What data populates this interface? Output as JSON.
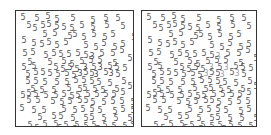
{
  "panels": [
    {
      "id": "left",
      "x": 15,
      "y": 10,
      "w": 119,
      "h": 117,
      "digit_color": "#555555",
      "target_color": "#444444",
      "distractor_digit": "5",
      "target_digit": "3",
      "digits": [
        [
          3,
          3,
          "5"
        ],
        [
          17,
          4,
          "5"
        ],
        [
          28,
          2,
          "5"
        ],
        [
          37,
          5,
          "5"
        ],
        [
          53,
          4,
          "5"
        ],
        [
          73,
          6,
          "5"
        ],
        [
          86,
          4,
          "5"
        ],
        [
          98,
          4,
          "5"
        ],
        [
          9,
          11,
          "5"
        ],
        [
          15,
          14,
          "5"
        ],
        [
          23,
          11,
          "5"
        ],
        [
          29,
          10,
          "5"
        ],
        [
          37,
          12,
          "5"
        ],
        [
          44,
          13,
          "5"
        ],
        [
          52,
          14,
          "5"
        ],
        [
          62,
          11,
          "5"
        ],
        [
          73,
          13,
          "5"
        ],
        [
          87,
          11,
          "5"
        ],
        [
          103,
          12,
          "5"
        ],
        [
          25,
          20,
          "5"
        ],
        [
          35,
          19,
          "5"
        ],
        [
          50,
          22,
          "5"
        ],
        [
          55,
          20,
          "5"
        ],
        [
          64,
          23,
          "5"
        ],
        [
          74,
          20,
          "5"
        ],
        [
          85,
          23,
          "5"
        ],
        [
          93,
          20,
          "5"
        ],
        [
          114,
          23,
          "5"
        ],
        [
          4,
          26,
          "5"
        ],
        [
          14,
          29,
          "5"
        ],
        [
          22,
          30,
          "5"
        ],
        [
          29,
          28,
          "5"
        ],
        [
          37,
          31,
          "5"
        ],
        [
          46,
          28,
          "5"
        ],
        [
          66,
          31,
          "5"
        ],
        [
          76,
          33,
          "5"
        ],
        [
          84,
          29,
          "5"
        ],
        [
          95,
          33,
          "5"
        ],
        [
          103,
          30,
          "5"
        ],
        [
          5,
          39,
          "5"
        ],
        [
          13,
          38,
          "5"
        ],
        [
          26,
          41,
          "5"
        ],
        [
          34,
          39,
          "5"
        ],
        [
          41,
          40,
          "5"
        ],
        [
          49,
          40,
          "5"
        ],
        [
          58,
          39,
          "5"
        ],
        [
          66,
          41,
          "5"
        ],
        [
          72,
          42,
          "3"
        ],
        [
          82,
          39,
          "5"
        ],
        [
          93,
          39,
          "5"
        ],
        [
          102,
          36,
          "5"
        ],
        [
          10,
          48,
          "5"
        ],
        [
          30,
          48,
          "5"
        ],
        [
          44,
          47,
          "5"
        ],
        [
          52,
          50,
          "5"
        ],
        [
          62,
          47,
          "5"
        ],
        [
          71,
          46,
          "5"
        ],
        [
          80,
          46,
          "5"
        ],
        [
          95,
          49,
          "5"
        ],
        [
          110,
          44,
          "5"
        ],
        [
          4,
          53,
          "5"
        ],
        [
          14,
          52,
          "5"
        ],
        [
          36,
          53,
          "5"
        ],
        [
          43,
          55,
          "5"
        ],
        [
          50,
          53,
          "5"
        ],
        [
          57,
          55,
          "5"
        ],
        [
          65,
          53,
          "3"
        ],
        [
          74,
          53,
          "5"
        ],
        [
          80,
          53,
          "3"
        ],
        [
          90,
          52,
          "5"
        ],
        [
          97,
          53,
          "5"
        ],
        [
          105,
          54,
          "5"
        ],
        [
          8,
          60,
          "5"
        ],
        [
          16,
          58,
          "5"
        ],
        [
          23,
          58,
          "5"
        ],
        [
          30,
          59,
          "5"
        ],
        [
          38,
          60,
          "5"
        ],
        [
          47,
          59,
          "5"
        ],
        [
          54,
          61,
          "5"
        ],
        [
          60,
          59,
          "3"
        ],
        [
          66,
          58,
          "5"
        ],
        [
          72,
          59,
          "5"
        ],
        [
          76,
          60,
          "3"
        ],
        [
          86,
          58,
          "5"
        ],
        [
          91,
          59,
          "3"
        ],
        [
          98,
          60,
          "5"
        ],
        [
          8,
          67,
          "5"
        ],
        [
          16,
          67,
          "5"
        ],
        [
          25,
          68,
          "5"
        ],
        [
          37,
          68,
          "5"
        ],
        [
          47,
          68,
          "5"
        ],
        [
          56,
          66,
          "5"
        ],
        [
          64,
          66,
          "5"
        ],
        [
          72,
          67,
          "5"
        ],
        [
          79,
          68,
          "5"
        ],
        [
          90,
          69,
          "5"
        ],
        [
          104,
          67,
          "5"
        ],
        [
          13,
          75,
          "5"
        ],
        [
          22,
          76,
          "5"
        ],
        [
          34,
          76,
          "5"
        ],
        [
          49,
          74,
          "5"
        ],
        [
          60,
          75,
          "5"
        ],
        [
          65,
          74,
          "5"
        ],
        [
          75,
          75,
          "5"
        ],
        [
          83,
          76,
          "5"
        ],
        [
          97,
          75,
          "5"
        ],
        [
          110,
          72,
          "5"
        ],
        [
          3,
          81,
          "5"
        ],
        [
          9,
          79,
          "5"
        ],
        [
          16,
          80,
          "5"
        ],
        [
          26,
          81,
          "5"
        ],
        [
          36,
          81,
          "5"
        ],
        [
          44,
          80,
          "5"
        ],
        [
          52,
          82,
          "5"
        ],
        [
          58,
          81,
          "5"
        ],
        [
          68,
          80,
          "5"
        ],
        [
          77,
          80,
          "5"
        ],
        [
          86,
          80,
          "5"
        ],
        [
          94,
          80,
          "5"
        ],
        [
          103,
          78,
          "5"
        ],
        [
          9,
          86,
          "5"
        ],
        [
          18,
          86,
          "5"
        ],
        [
          33,
          87,
          "5"
        ],
        [
          42,
          88,
          "5"
        ],
        [
          50,
          87,
          "5"
        ],
        [
          60,
          86,
          "5"
        ],
        [
          66,
          86,
          "5"
        ],
        [
          73,
          88,
          "5"
        ],
        [
          84,
          88,
          "5"
        ],
        [
          93,
          87,
          "5"
        ],
        [
          102,
          87,
          "5"
        ],
        [
          113,
          88,
          "5"
        ],
        [
          2,
          94,
          "5"
        ],
        [
          14,
          96,
          "5"
        ],
        [
          24,
          96,
          "5"
        ],
        [
          44,
          95,
          "5"
        ],
        [
          55,
          96,
          "5"
        ],
        [
          63,
          95,
          "5"
        ],
        [
          72,
          95,
          "5"
        ],
        [
          80,
          96,
          "5"
        ],
        [
          95,
          97,
          "5"
        ],
        [
          103,
          95,
          "5"
        ],
        [
          113,
          96,
          "5"
        ],
        [
          20,
          103,
          "5"
        ],
        [
          34,
          102,
          "5"
        ],
        [
          41,
          102,
          "5"
        ],
        [
          53,
          104,
          "5"
        ],
        [
          66,
          104,
          "5"
        ],
        [
          72,
          103,
          "5"
        ],
        [
          84,
          104,
          "5"
        ],
        [
          96,
          104,
          "5"
        ],
        [
          110,
          104,
          "5"
        ],
        [
          10,
          111,
          "5"
        ],
        [
          25,
          110,
          "5"
        ],
        [
          36,
          110,
          "5"
        ],
        [
          46,
          111,
          "5"
        ],
        [
          57,
          111,
          "5"
        ],
        [
          66,
          112,
          "5"
        ],
        [
          74,
          111,
          "5"
        ],
        [
          85,
          111,
          "5"
        ],
        [
          94,
          112,
          "5"
        ],
        [
          105,
          112,
          "5"
        ],
        [
          113,
          111,
          "5"
        ],
        [
          17,
          114,
          "5"
        ],
        [
          40,
          114,
          "5"
        ],
        [
          55,
          115,
          "5"
        ],
        [
          78,
          115,
          "5"
        ]
      ]
    },
    {
      "id": "right",
      "x": 141,
      "y": 10,
      "w": 116,
      "h": 117,
      "digit_color": "#555555",
      "target_color": "#9a9a9a",
      "distractor_digit": "5",
      "target_digit": "3",
      "digits_source": "left"
    }
  ]
}
